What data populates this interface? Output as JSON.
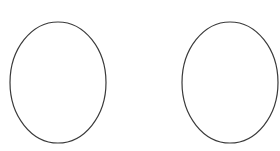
{
  "canvas": {
    "width": 280,
    "height": 151,
    "background": "#ffffff"
  },
  "shapes": [
    {
      "type": "ellipse",
      "cx": 58,
      "cy": 82.5,
      "rx": 48,
      "ry": 60.5,
      "stroke": "#3a3a3a",
      "stroke_width": 1.2,
      "fill": "none"
    },
    {
      "type": "ellipse",
      "cx": 230,
      "cy": 82.5,
      "rx": 48,
      "ry": 60.5,
      "stroke": "#3a3a3a",
      "stroke_width": 1.2,
      "fill": "none"
    }
  ]
}
